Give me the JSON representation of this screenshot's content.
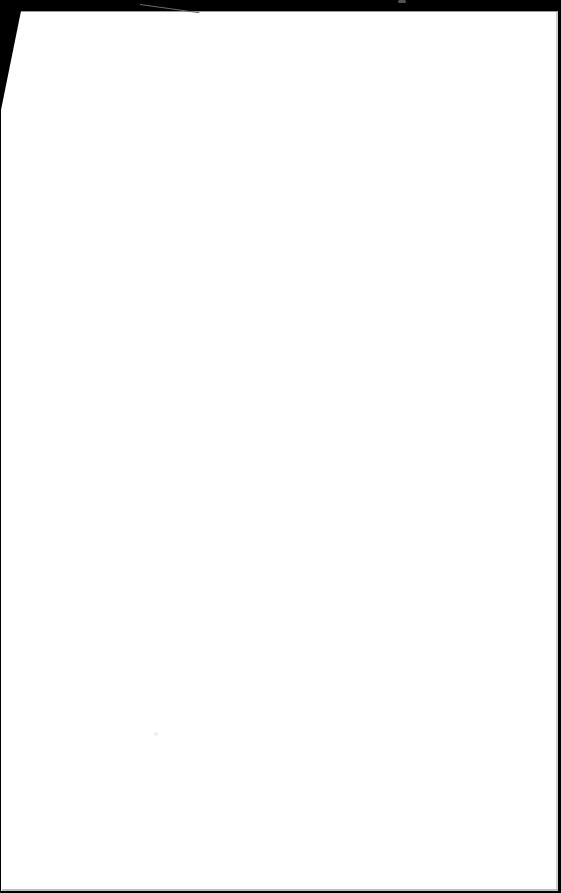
{
  "page": {
    "kind": "blank-paper-sheet",
    "text": "",
    "colors": {
      "background": "#000000",
      "paper": "#ffffff",
      "paper_edge": "#cfcfcf"
    }
  }
}
